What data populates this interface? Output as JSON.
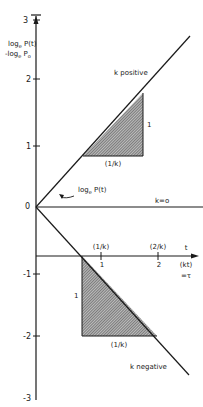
{
  "diagram": {
    "title": "",
    "y_axis": {
      "label_line1": "log",
      "label_line1_sub": "e",
      "label_line1_rest": " P(t)",
      "label_line2": "-log",
      "label_line2_sub": "e",
      "label_line2_rest": " P",
      "label_line2_sub2": "o",
      "ticks": [
        "3",
        "2",
        "1",
        "0",
        "-1",
        "-2",
        "-3"
      ]
    },
    "t_axis": {
      "label_t": "t",
      "label_kt": "(kt)",
      "label_tau": "=τ",
      "ticks_below": [
        "1",
        "2"
      ],
      "ticks_above": [
        "(1/k)",
        "(2/k)"
      ]
    },
    "lines": {
      "positive": "k positive",
      "zero": "k=o",
      "negative": "k negative"
    },
    "curve_label": {
      "prefix": "log",
      "sub": "e",
      "suffix": " P(t)"
    },
    "upper_triangle": {
      "horizontal": "(1/k)",
      "vertical": "1"
    },
    "lower_triangle": {
      "horizontal": "(1/k)",
      "vertical": "1"
    },
    "colors": {
      "line": "#1a1a1a",
      "hatch": "#444444",
      "background": "#ffffff"
    }
  }
}
